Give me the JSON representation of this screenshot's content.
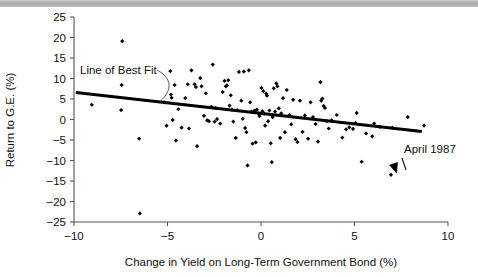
{
  "chart_data": {
    "type": "scatter",
    "title": "",
    "xlabel": "Change in Yield on Long-Term Government Bond (%)",
    "ylabel": "Return to G.E. (%)",
    "xlim": [
      -10,
      10
    ],
    "ylim": [
      -25,
      25
    ],
    "xticks": [
      -10,
      -5,
      0,
      5,
      10
    ],
    "yticks": [
      -25,
      -20,
      -15,
      -10,
      -5,
      0,
      5,
      10,
      15,
      20,
      25
    ],
    "xticklabels": [
      "-10",
      "-5",
      "0",
      "5",
      "10"
    ],
    "yticklabels": [
      "-25",
      "-20",
      "-15",
      "-10",
      "-5",
      "0",
      "5",
      "10",
      "15",
      "20",
      "25"
    ],
    "grid": false,
    "legend": null,
    "marker": "diamond",
    "marker_color": "#000000",
    "series": [
      {
        "name": "Monthly observations",
        "points": [
          [
            -9.05,
            3.6
          ],
          [
            -7.42,
            19.1
          ],
          [
            -7.45,
            8.4
          ],
          [
            -7.48,
            2.3
          ],
          [
            -6.52,
            -4.7
          ],
          [
            -6.48,
            -22.9
          ],
          [
            -5.18,
            4.2
          ],
          [
            -5.05,
            -1.5
          ],
          [
            -4.85,
            11.8
          ],
          [
            -4.82,
            6.1
          ],
          [
            -4.78,
            5.3
          ],
          [
            -4.72,
            -0.1
          ],
          [
            -4.62,
            8.4
          ],
          [
            -4.55,
            -5.1
          ],
          [
            -4.42,
            2.5
          ],
          [
            -4.25,
            -2.0
          ],
          [
            -4.05,
            5.2
          ],
          [
            -3.92,
            8.6
          ],
          [
            -3.85,
            -2.2
          ],
          [
            -3.72,
            12.0
          ],
          [
            -3.55,
            8.6
          ],
          [
            -3.48,
            7.9
          ],
          [
            -3.42,
            -6.5
          ],
          [
            -3.25,
            10.1
          ],
          [
            -3.18,
            8.1
          ],
          [
            -3.05,
            0.9
          ],
          [
            -2.95,
            6.4
          ],
          [
            -2.88,
            -0.2
          ],
          [
            -2.78,
            -0.4
          ],
          [
            -2.65,
            3.1
          ],
          [
            -2.58,
            13.4
          ],
          [
            -2.48,
            -0.5
          ],
          [
            -2.42,
            2.8
          ],
          [
            -2.35,
            0.1
          ],
          [
            -2.18,
            -1.0
          ],
          [
            -2.05,
            6.7
          ],
          [
            -1.95,
            9.4
          ],
          [
            -1.88,
            8.1
          ],
          [
            -1.82,
            8.3
          ],
          [
            -1.75,
            9.6
          ],
          [
            -1.68,
            3.4
          ],
          [
            -1.62,
            5.9
          ],
          [
            -1.55,
            2.4
          ],
          [
            -1.48,
            -0.5
          ],
          [
            -1.35,
            -4.5
          ],
          [
            -1.28,
            2.3
          ],
          [
            -1.18,
            11.6
          ],
          [
            -1.05,
            4.6
          ],
          [
            -0.98,
            0.2
          ],
          [
            -0.92,
            11.7
          ],
          [
            -0.85,
            -2.1
          ],
          [
            -0.78,
            -3.1
          ],
          [
            -0.72,
            -11.2
          ],
          [
            -0.65,
            12.0
          ],
          [
            -0.58,
            4.2
          ],
          [
            -0.52,
            1.9
          ],
          [
            -0.45,
            -5.9
          ],
          [
            -0.38,
            2.0
          ],
          [
            -0.32,
            2.2
          ],
          [
            -0.28,
            -5.6
          ],
          [
            -0.22,
            2.4
          ],
          [
            -0.15,
            1.5
          ],
          [
            -0.08,
            0.8
          ],
          [
            0.02,
            7.7
          ],
          [
            0.08,
            2.0
          ],
          [
            0.12,
            6.9
          ],
          [
            0.18,
            1.4
          ],
          [
            0.22,
            -1.5
          ],
          [
            0.28,
            6.3
          ],
          [
            0.32,
            5.8
          ],
          [
            0.38,
            -0.4
          ],
          [
            0.45,
            2.2
          ],
          [
            0.52,
            -5.8
          ],
          [
            0.58,
            -10.4
          ],
          [
            0.62,
            0.6
          ],
          [
            0.68,
            7.6
          ],
          [
            0.75,
            1.9
          ],
          [
            0.82,
            8.8
          ],
          [
            0.88,
            8.1
          ],
          [
            0.95,
            2.7
          ],
          [
            1.02,
            -4.5
          ],
          [
            1.08,
            1.5
          ],
          [
            1.18,
            5.2
          ],
          [
            1.28,
            -3.1
          ],
          [
            1.38,
            7.2
          ],
          [
            1.52,
            1.1
          ],
          [
            1.62,
            -1.2
          ],
          [
            1.72,
            4.8
          ],
          [
            1.85,
            -4.8
          ],
          [
            1.95,
            -5.5
          ],
          [
            2.08,
            4.6
          ],
          [
            2.22,
            -3.0
          ],
          [
            2.35,
            1.0
          ],
          [
            2.52,
            -4.7
          ],
          [
            2.65,
            4.2
          ],
          [
            2.78,
            0.6
          ],
          [
            2.92,
            -1.1
          ],
          [
            3.05,
            -5.4
          ],
          [
            3.18,
            9.1
          ],
          [
            3.22,
            4.6
          ],
          [
            3.28,
            5.1
          ],
          [
            3.35,
            3.3
          ],
          [
            3.42,
            2.8
          ],
          [
            3.52,
            -0.4
          ],
          [
            3.62,
            -2.2
          ],
          [
            3.78,
            -0.2
          ],
          [
            4.05,
            1.1
          ],
          [
            4.35,
            -4.4
          ],
          [
            4.55,
            -2.4
          ],
          [
            4.72,
            -1.9
          ],
          [
            4.92,
            -2.3
          ],
          [
            5.05,
            -0.9
          ],
          [
            5.12,
            1.6
          ],
          [
            5.38,
            -10.3
          ],
          [
            5.62,
            -3.4
          ],
          [
            5.95,
            -4.1
          ],
          [
            6.05,
            -1.0
          ],
          [
            6.35,
            -1.8
          ],
          [
            6.95,
            -13.5
          ],
          [
            7.02,
            -2.0
          ],
          [
            7.85,
            0.6
          ],
          [
            8.72,
            -1.5
          ]
        ]
      }
    ],
    "trendline": {
      "label": "Line of Best Fit",
      "x_start": -9.9,
      "y_start": 6.6,
      "x_end": 8.6,
      "y_end": -2.9,
      "color": "#000000"
    },
    "annotations": [
      {
        "text": "Line of Best Fit",
        "target_x": -5.4,
        "target_y": 4.4
      },
      {
        "text": "April 1987",
        "target_x": 6.95,
        "target_y": -13.5
      }
    ]
  }
}
